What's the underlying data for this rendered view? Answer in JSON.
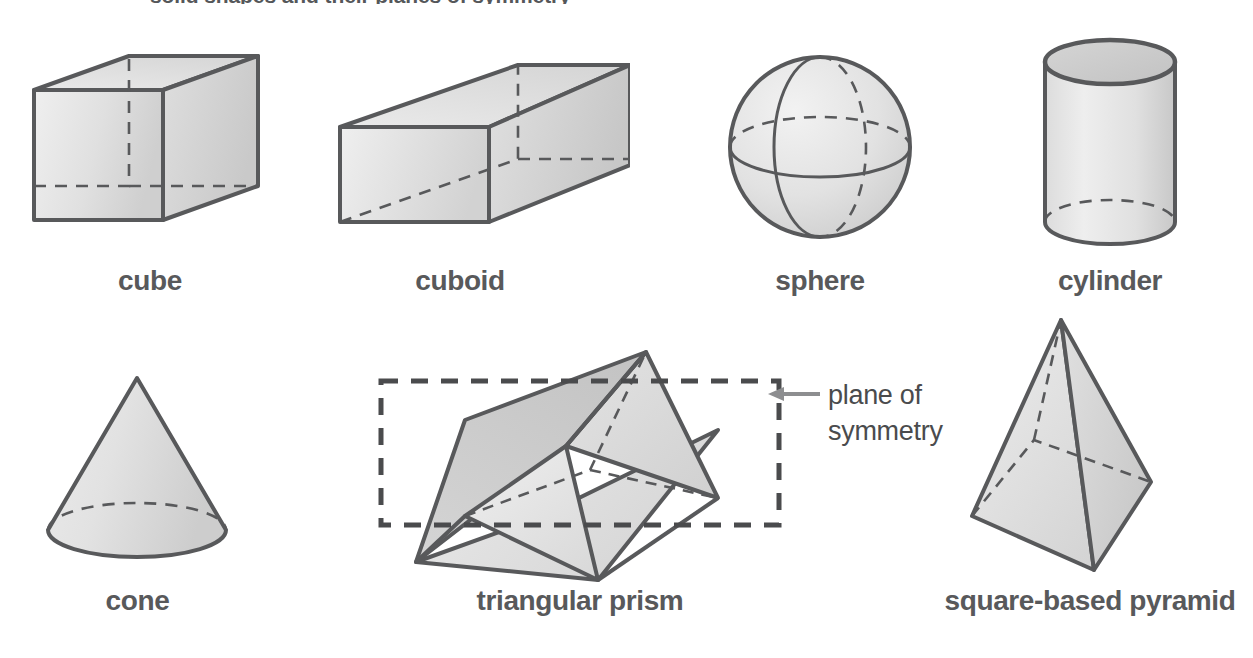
{
  "page": {
    "title_partial": "solid shapes and their planes of symmetry",
    "background_color": "#ffffff",
    "ink_color": "#58595b",
    "fill_light": "#f4f4f4",
    "fill_mid": "#dcdcdc",
    "fill_dark": "#c6c6c6"
  },
  "figures": [
    {
      "id": "cube",
      "label": "cube",
      "icon": "cube-icon",
      "row": 1,
      "column": 1,
      "faces_visible": [
        "front",
        "top",
        "right"
      ],
      "hidden_edges": "dashed"
    },
    {
      "id": "cuboid",
      "label": "cuboid",
      "icon": "cuboid-icon",
      "row": 1,
      "column": 2,
      "faces_visible": [
        "front",
        "top",
        "right"
      ],
      "hidden_edges": "dashed"
    },
    {
      "id": "sphere",
      "label": "sphere",
      "icon": "sphere-icon",
      "row": 1,
      "column": 3,
      "guide_circles": [
        "meridian",
        "equator"
      ],
      "hidden_edges": "dashed"
    },
    {
      "id": "cylinder",
      "label": "cylinder",
      "icon": "cylinder-icon",
      "row": 1,
      "column": 4,
      "faces_visible": [
        "top-ellipse",
        "side"
      ],
      "hidden_edges": "dashed"
    },
    {
      "id": "cone",
      "label": "cone",
      "icon": "cone-icon",
      "row": 2,
      "column": 1,
      "faces_visible": [
        "lateral",
        "base-ellipse"
      ],
      "hidden_edges": "dashed"
    },
    {
      "id": "triangular-prism",
      "label": "triangular prism",
      "icon": "triangular-prism-icon",
      "row": 2,
      "column": 2,
      "faces_visible": [
        "front-triangle",
        "top-rectangle",
        "bottom-rectangle"
      ],
      "hidden_edges": "dashed",
      "has_symmetry_plane": true
    },
    {
      "id": "square-based-pyramid",
      "label": "square-based pyramid",
      "icon": "square-based-pyramid-icon",
      "row": 2,
      "column": 3,
      "faces_visible": [
        "left-face",
        "front-face"
      ],
      "hidden_edges": "dashed"
    }
  ],
  "annotation": {
    "id": "plane-of-symmetry",
    "line1": "plane of",
    "line2": "symmetry",
    "arrow": "left-arrow-icon",
    "arrow_color": "#8d8e90",
    "plane_style": "dashed-rectangle",
    "plane_color": "#4a4b4d"
  }
}
